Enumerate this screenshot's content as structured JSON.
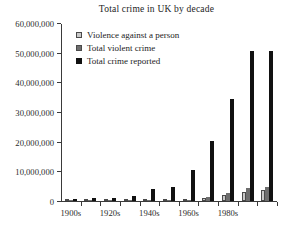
{
  "chart_data": {
    "type": "bar",
    "title": "Total crime in UK by decade",
    "xlabel": "",
    "ylabel": "",
    "ylim": [
      0,
      60000000
    ],
    "yticks": [
      0,
      10000000,
      20000000,
      30000000,
      40000000,
      50000000,
      60000000
    ],
    "ytick_labels": [
      "0",
      "10,000,000",
      "20,000,000",
      "30,000,000",
      "40,000,000",
      "50,000,000",
      "60,000,000"
    ],
    "grid": false,
    "legend_position": "top-left-inside",
    "categories": [
      "1900s",
      "1910s",
      "1920s",
      "1930s",
      "1940s",
      "1950s",
      "1960s",
      "1970s",
      "1980s",
      "1990s",
      "2000s"
    ],
    "visible_xtick_labels": [
      "1900s",
      "1920s",
      "1940s",
      "1960s",
      "1980s"
    ],
    "series": [
      {
        "name": "Violence against a person",
        "color": "#c9c9c9",
        "values": [
          40000,
          50000,
          60000,
          70000,
          90000,
          110000,
          180000,
          900000,
          1900000,
          3000000,
          3600000
        ]
      },
      {
        "name": "Total violent crime",
        "color": "#6e6e6e",
        "values": [
          60000,
          70000,
          90000,
          110000,
          140000,
          180000,
          350000,
          1300000,
          2600000,
          4300000,
          4800000
        ]
      },
      {
        "name": "Total crime reported",
        "color": "#111111",
        "values": [
          800000,
          900000,
          1000000,
          1800000,
          4000000,
          4700000,
          10500000,
          20400000,
          34500000,
          51000000,
          51000000
        ]
      }
    ]
  },
  "legend": {
    "items": [
      {
        "label": "Violence against a person"
      },
      {
        "label": "Total violent crime"
      },
      {
        "label": "Total crime reported"
      }
    ]
  }
}
